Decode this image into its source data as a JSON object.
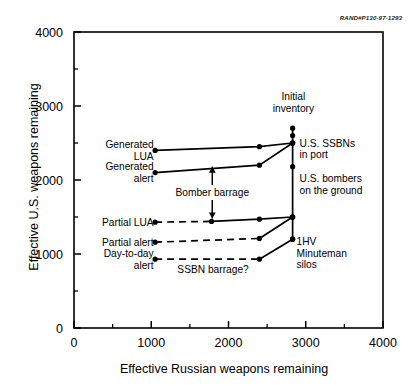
{
  "figure": {
    "corner_id": "RAND#P130-97-1293",
    "background_color": "#ffffff",
    "line_color": "#000000"
  },
  "chart_data": {
    "type": "line",
    "title": "",
    "xlabel": "Effective Russian weapons remaining",
    "ylabel": "Effective U.S. weapons remaining",
    "xlim": [
      0,
      4000
    ],
    "ylim": [
      0,
      4000
    ],
    "xticks": [
      0,
      1000,
      2000,
      3000,
      4000
    ],
    "yticks": [
      0,
      1000,
      2000,
      3000,
      4000
    ],
    "xticklabels": [
      "0",
      "1000",
      "2000",
      "3000",
      "4000"
    ],
    "yticklabels": [
      "0",
      "1000",
      "2000",
      "3000",
      "4000"
    ],
    "minor_tick_step": 500,
    "grid": false,
    "legend": "none",
    "series": [
      {
        "name": "Generated LUA",
        "style": "solid",
        "x": [
          1050,
          2400,
          2830
        ],
        "y": [
          2400,
          2450,
          2500
        ]
      },
      {
        "name": "Generated alert",
        "style": "solid",
        "x": [
          1050,
          2400,
          2830
        ],
        "y": [
          2100,
          2200,
          2500
        ]
      },
      {
        "name": "Partial LUA",
        "style": "dashed-then-solid",
        "x": [
          1050,
          1780,
          2400,
          2830
        ],
        "y": [
          1430,
          1440,
          1470,
          1500
        ]
      },
      {
        "name": "Partial alert",
        "style": "dashed-then-solid",
        "x": [
          1050,
          2400,
          2830
        ],
        "y": [
          1160,
          1210,
          1500
        ]
      },
      {
        "name": "Day-to-day alert",
        "style": "dashed-then-solid",
        "x": [
          1050,
          2400,
          2830
        ],
        "y": [
          930,
          930,
          1200
        ]
      }
    ],
    "vertical_line": {
      "x": 2830,
      "y_from": 1200,
      "y_to": 2700,
      "markers": [
        2700,
        2600,
        2500,
        2180,
        1500,
        1200
      ]
    },
    "annotations": [
      {
        "id": "generated-lua",
        "text_lines": [
          "Generated",
          "LUA"
        ],
        "anchor": "end",
        "x": 1030,
        "y": 2400
      },
      {
        "id": "generated-alert",
        "text_lines": [
          "Generated",
          "alert"
        ],
        "anchor": "end",
        "x": 1030,
        "y": 2100
      },
      {
        "id": "partial-lua",
        "text_lines": [
          "Partial LUA"
        ],
        "anchor": "end",
        "x": 1030,
        "y": 1430
      },
      {
        "id": "partial-alert",
        "text_lines": [
          "Partial alert"
        ],
        "anchor": "end",
        "x": 1030,
        "y": 1160
      },
      {
        "id": "day-to-day-alert",
        "text_lines": [
          "Day-to-day",
          "alert"
        ],
        "anchor": "end",
        "x": 1030,
        "y": 930
      },
      {
        "id": "bomber-barrage",
        "text_lines": [
          "Bomber barrage"
        ],
        "anchor": "middle",
        "x": 1790,
        "y": 1830
      },
      {
        "id": "ssbn-barrage",
        "text_lines": [
          "SSBN barrage?"
        ],
        "anchor": "middle",
        "x": 1800,
        "y": 790
      },
      {
        "id": "initial-inventory",
        "text_lines": [
          "Initial",
          "inventory"
        ],
        "anchor": "middle",
        "x": 2840,
        "y": 3050
      },
      {
        "id": "us-ssbns-in-port",
        "text_lines": [
          "U.S. SSBNs",
          "in port"
        ],
        "anchor": "start",
        "x": 2920,
        "y": 2420
      },
      {
        "id": "us-bombers-on-ground",
        "text_lines": [
          "U.S. bombers",
          "on the ground"
        ],
        "anchor": "start",
        "x": 2920,
        "y": 1940
      },
      {
        "id": "minuteman-silos",
        "text_lines": [
          "1HV",
          "Minuteman",
          "silos"
        ],
        "anchor": "start",
        "x": 2880,
        "y": 1010
      }
    ],
    "arrows": [
      {
        "id": "bomber-barrage-arrow-up",
        "x": 1790,
        "y_tail": 1930,
        "y_head": 2180
      },
      {
        "id": "bomber-barrage-arrow-down",
        "x": 1790,
        "y_tail": 1730,
        "y_head": 1480
      }
    ]
  }
}
